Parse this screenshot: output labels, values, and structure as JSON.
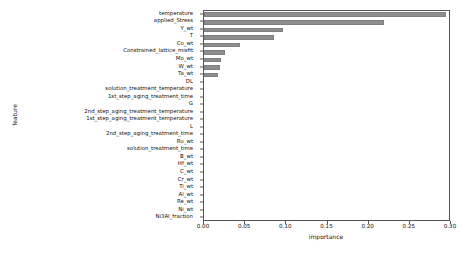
{
  "chart_data": {
    "type": "bar",
    "orientation": "horizontal",
    "title": "",
    "xlabel": "importance",
    "ylabel": "feature",
    "xlim": [
      0.0,
      0.3
    ],
    "ylim": null,
    "grid": false,
    "legend": null,
    "bar_color": "#8e8e8e",
    "xticks": [
      "0.00",
      "0.05",
      "0.10",
      "0.15",
      "0.20",
      "0.25",
      "0.30"
    ],
    "xtick_values": [
      0.0,
      0.05,
      0.1,
      0.15,
      0.2,
      0.25,
      0.3
    ],
    "categories": [
      "temperature",
      "applied_Stress",
      "Y_wt",
      "T",
      "Co_wt",
      "Constrained_lattice_misfit",
      "Mo_wt",
      "W_wt",
      "Ta_wt",
      "DL",
      "solution_treatment_temperature",
      "1st_step_aging_treatment_time",
      "G",
      "2nd_step_aging_treatment_temperature",
      "1st_step_aging_treatment_temperature",
      "L",
      "2nd_step_aging_treatment_time",
      "Ru_wt",
      "solution_treatment_time",
      "B_wt",
      "Hf_wt",
      "C_wt",
      "Cr_wt",
      "Ti_wt",
      "Al_wt",
      "Re_wt",
      "Ni_wt",
      "Ni3Al_fraction"
    ],
    "values": [
      0.294,
      0.219,
      0.096,
      0.085,
      0.044,
      0.026,
      0.021,
      0.0195,
      0.0175,
      0.0,
      0.0,
      0.0,
      0.0,
      0.0,
      0.0,
      0.0,
      0.0,
      0.0,
      0.0,
      0.0,
      0.0,
      0.0,
      0.0,
      0.0,
      0.0,
      0.0,
      0.0,
      0.0
    ]
  }
}
